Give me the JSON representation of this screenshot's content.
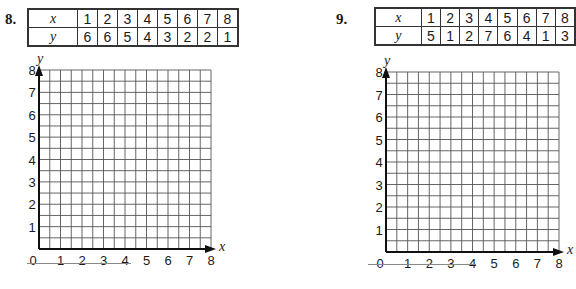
{
  "problems": [
    {
      "number": "8.",
      "table": {
        "x_label": "x",
        "y_label": "y",
        "x_values": [
          "1",
          "2",
          "3",
          "4",
          "5",
          "6",
          "7",
          "8"
        ],
        "y_values": [
          "6",
          "6",
          "5",
          "4",
          "3",
          "2",
          "2",
          "1"
        ]
      },
      "graph": {
        "x_axis_label": "x",
        "y_axis_label": "y",
        "x_ticks": [
          "0",
          "1",
          "2",
          "3",
          "4",
          "5",
          "6",
          "7",
          "8"
        ],
        "y_ticks": [
          "1",
          "2",
          "3",
          "4",
          "5",
          "6",
          "7",
          "8"
        ]
      }
    },
    {
      "number": "9.",
      "table": {
        "x_label": "x",
        "y_label": "y",
        "x_values": [
          "1",
          "2",
          "3",
          "4",
          "5",
          "6",
          "7",
          "8"
        ],
        "y_values": [
          "5",
          "1",
          "2",
          "7",
          "6",
          "4",
          "1",
          "3"
        ]
      },
      "graph": {
        "x_axis_label": "x",
        "y_axis_label": "y",
        "x_ticks": [
          "0",
          "1",
          "2",
          "3",
          "4",
          "5",
          "6",
          "7",
          "8"
        ],
        "y_ticks": [
          "1",
          "2",
          "3",
          "4",
          "5",
          "6",
          "7",
          "8"
        ]
      }
    }
  ],
  "chart_data": [
    {
      "type": "table",
      "title": "8.",
      "x": [
        1,
        2,
        3,
        4,
        5,
        6,
        7,
        8
      ],
      "y": [
        6,
        6,
        5,
        4,
        3,
        2,
        2,
        1
      ],
      "xlabel": "x",
      "ylabel": "y",
      "xlim": [
        0,
        8
      ],
      "ylim": [
        0,
        8
      ],
      "grid": true,
      "note": "Blank coordinate grid with half-unit gridlines for plotting"
    },
    {
      "type": "table",
      "title": "9.",
      "x": [
        1,
        2,
        3,
        4,
        5,
        6,
        7,
        8
      ],
      "y": [
        5,
        1,
        2,
        7,
        6,
        4,
        1,
        3
      ],
      "xlabel": "x",
      "ylabel": "y",
      "xlim": [
        0,
        8
      ],
      "ylim": [
        0,
        8
      ],
      "grid": true,
      "note": "Blank coordinate grid with half-unit gridlines for plotting"
    }
  ]
}
